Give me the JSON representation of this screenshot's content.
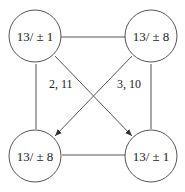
{
  "nodes": [
    {
      "id": "tl",
      "label": "13/ ± 1"
    },
    {
      "id": "tr",
      "label": "13/ ± 8"
    },
    {
      "id": "bl",
      "label": "13/ ± 8"
    },
    {
      "id": "br",
      "label": "13/ ± 1"
    }
  ],
  "edges": [
    {
      "from": "tl",
      "to": "tr",
      "directed": false,
      "label": ""
    },
    {
      "from": "tl",
      "to": "bl",
      "directed": false,
      "label": ""
    },
    {
      "from": "tr",
      "to": "br",
      "directed": false,
      "label": ""
    },
    {
      "from": "bl",
      "to": "br",
      "directed": false,
      "label": ""
    },
    {
      "from": "tl",
      "to": "br",
      "directed": true,
      "label": "2, 11"
    },
    {
      "from": "tr",
      "to": "bl",
      "directed": true,
      "label": "3, 10"
    }
  ]
}
